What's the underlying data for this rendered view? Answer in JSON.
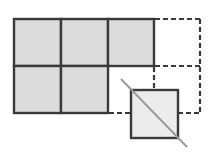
{
  "diagram": {
    "width": 210,
    "height": 155,
    "colors": {
      "background": "#ffffff",
      "stroke": "#3a3a3a",
      "cell_fill": "#dcdcdc",
      "small_square_fill": "#ececec",
      "diagonal": "#9a9a9a"
    },
    "grid": {
      "cell_size": 47,
      "origin": [
        14,
        18
      ],
      "filled_cells": [
        {
          "row": 0,
          "col": 0
        },
        {
          "row": 0,
          "col": 1
        },
        {
          "row": 0,
          "col": 2
        },
        {
          "row": 1,
          "col": 0
        },
        {
          "row": 1,
          "col": 1
        }
      ],
      "dashed_cells": [
        {
          "row": 0,
          "col": 3
        },
        {
          "row": 1,
          "col": 2
        },
        {
          "row": 1,
          "col": 3
        }
      ]
    },
    "small_square": {
      "x": 131,
      "y": 90,
      "size": 47
    },
    "diagonal_line": {
      "x1": 121,
      "y1": 79,
      "x2": 187,
      "y2": 147
    }
  }
}
